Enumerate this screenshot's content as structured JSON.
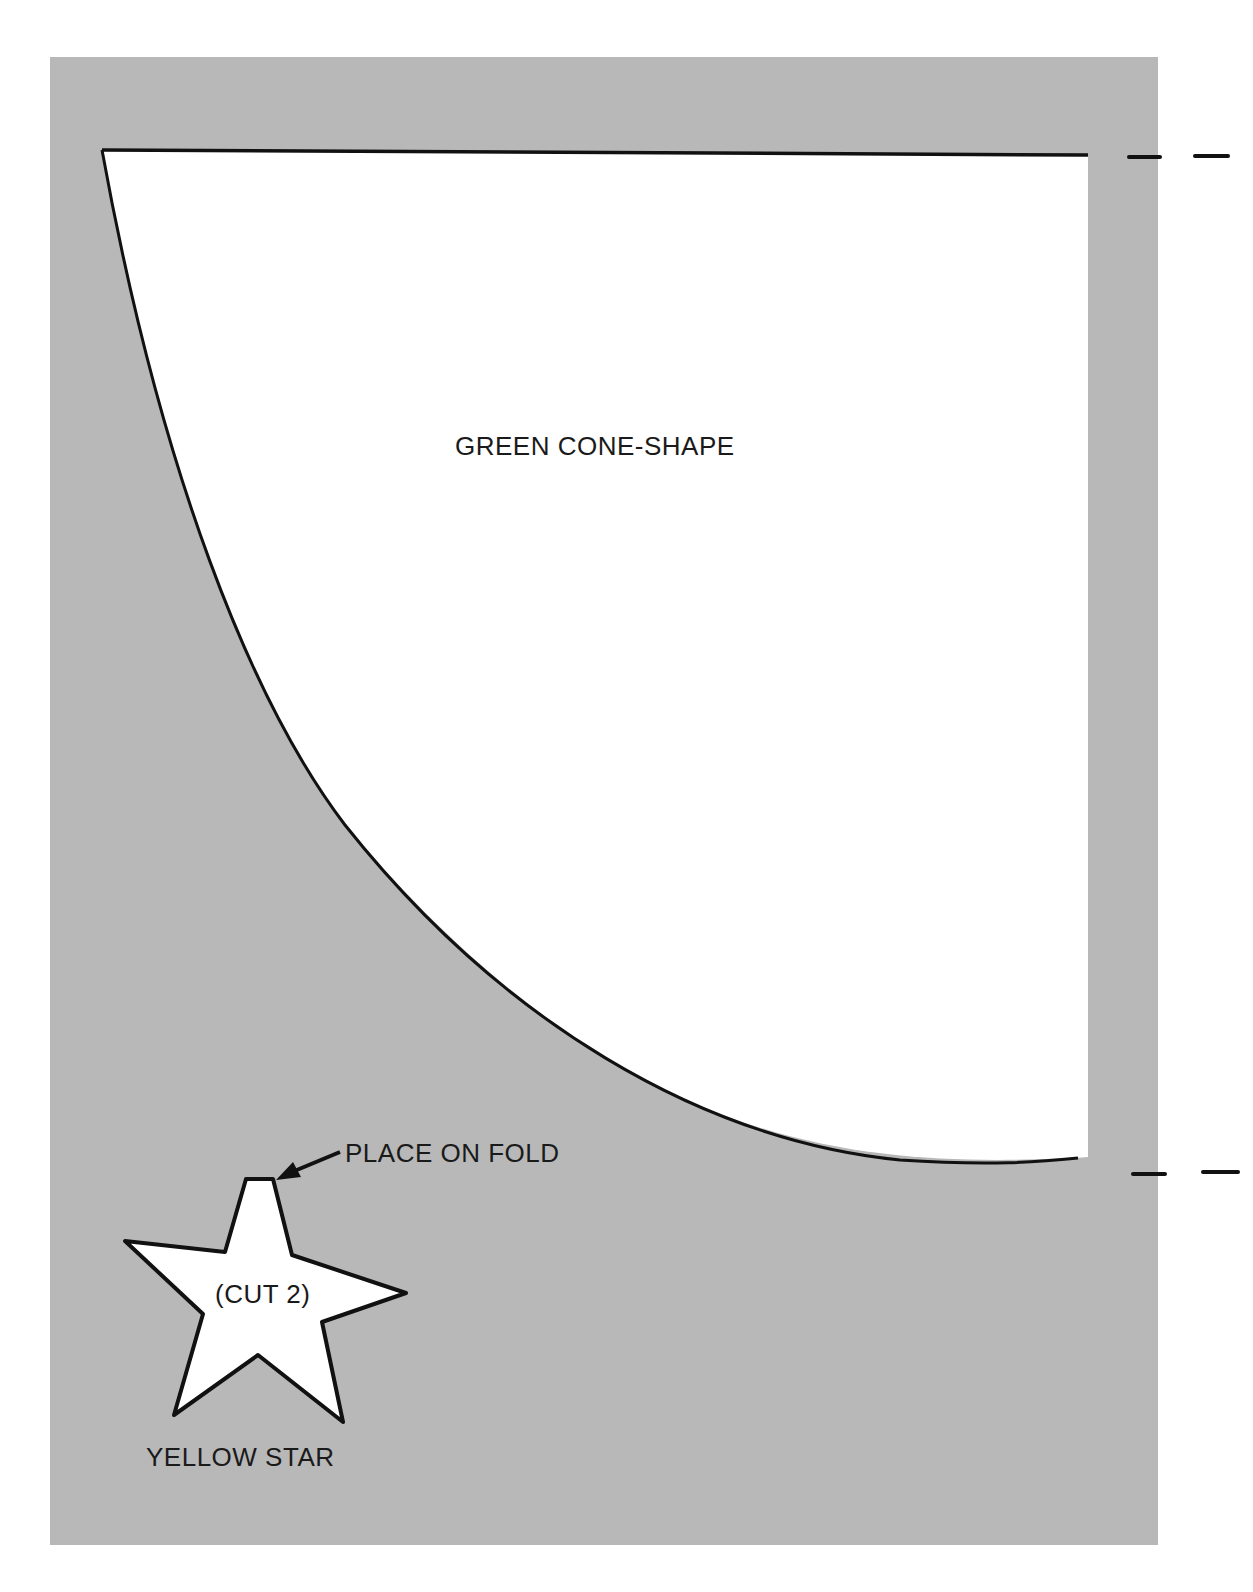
{
  "pattern": {
    "cone": {
      "label": "GREEN CONE-SHAPE",
      "fill": "#ffffff",
      "stroke": "#111111"
    },
    "star": {
      "label_inside": "(CUT 2)",
      "label_below": "YELLOW STAR",
      "fold_note": "PLACE ON FOLD",
      "fill": "#ffffff",
      "stroke": "#111111"
    },
    "background_color": "#b8b8b8",
    "fold_marks": [
      "top-fold-mark",
      "bottom-fold-mark"
    ]
  }
}
